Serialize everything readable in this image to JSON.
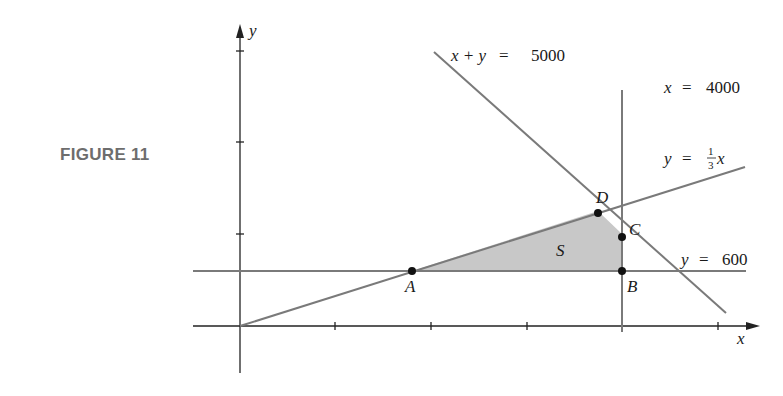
{
  "figure": {
    "label": "FIGURE 11",
    "axis_x_label": "x",
    "axis_y_label": "y",
    "region_label": "S",
    "points": [
      {
        "name": "A",
        "x": 1800,
        "y": 600
      },
      {
        "name": "B",
        "x": 4000,
        "y": 600
      },
      {
        "name": "C",
        "x": 4000,
        "y": 1000
      },
      {
        "name": "D",
        "x": 3750,
        "y": 1250
      }
    ],
    "lines": [
      {
        "equation": "x + y = 5000",
        "lhs": "x + y",
        "rhs": "5000"
      },
      {
        "equation": "x = 4000",
        "lhs": "x",
        "rhs": "4000"
      },
      {
        "equation": "y = (1/3)x",
        "lhs": "y",
        "coef_num": "1",
        "coef_den": "3",
        "var": "x"
      },
      {
        "equation": "y = 600",
        "lhs": "y",
        "rhs": "600"
      }
    ],
    "colors": {
      "line": "#7a7a7a",
      "axis": "#222222",
      "region_fill": "#c8c8c8",
      "point": "#111111"
    }
  }
}
